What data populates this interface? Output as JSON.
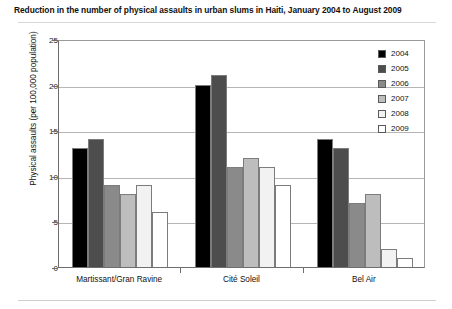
{
  "chart_data": {
    "type": "bar",
    "title": "Reduction in the number of physical assaults in urban slums in Haiti, January 2004 to August 2009",
    "xlabel": "",
    "ylabel": "Physical assaults (per 100,000 population)",
    "ylim": [
      0,
      25
    ],
    "yticks": [
      0,
      5,
      10,
      15,
      20,
      25
    ],
    "ytick_labels": [
      "0",
      "5",
      "10",
      "15",
      "20",
      "25"
    ],
    "grid": true,
    "legend_position": "top-right",
    "categories": [
      "Martissant/Gran Ravine",
      "Cité Soleil",
      "Bel Air"
    ],
    "series": [
      {
        "name": "2004",
        "color": "#000000",
        "values": [
          13,
          20,
          14
        ]
      },
      {
        "name": "2005",
        "color": "#4d4d4d",
        "values": [
          14,
          21,
          13
        ]
      },
      {
        "name": "2006",
        "color": "#8a8a8a",
        "values": [
          9,
          11,
          7
        ]
      },
      {
        "name": "2007",
        "color": "#bdbdbd",
        "values": [
          8,
          12,
          8
        ]
      },
      {
        "name": "2008",
        "color": "#f2f2f2",
        "values": [
          9,
          11,
          2
        ]
      },
      {
        "name": "2009",
        "color": "#ffffff",
        "values": [
          6,
          9,
          1
        ]
      }
    ]
  }
}
